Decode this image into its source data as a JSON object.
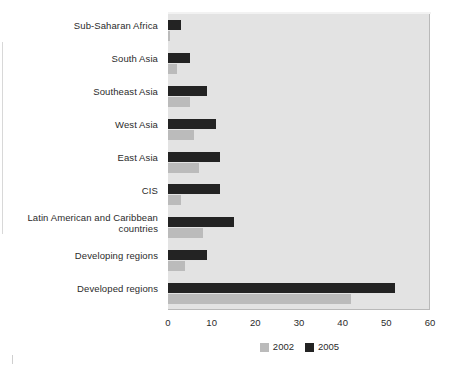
{
  "chart_data": {
    "type": "bar",
    "orientation": "horizontal",
    "title": "",
    "subtitle": "",
    "xlabel": "",
    "ylabel": "",
    "xlim": [
      0,
      60
    ],
    "xticks": [
      0,
      10,
      20,
      30,
      40,
      50,
      60
    ],
    "xtick_labels": [
      "0",
      "10",
      "20",
      "30",
      "40",
      "50",
      "60"
    ],
    "grid": false,
    "legend_position": "bottom-center",
    "categories": [
      "Sub-Saharan Africa",
      "South Asia",
      "Southeast Asia",
      "West Asia",
      "East Asia",
      "CIS",
      "Latin American and Caribbean countries",
      "Developing regions",
      "Developed regions"
    ],
    "series": [
      {
        "name": "2002",
        "color": "#bbbbbb",
        "values": [
          0.5,
          2,
          5,
          6,
          7,
          3,
          8,
          4,
          42
        ]
      },
      {
        "name": "2005",
        "color": "#232323",
        "values": [
          3,
          5,
          9,
          11,
          12,
          12,
          15,
          9,
          52
        ]
      }
    ],
    "legend": [
      "2002",
      "2005"
    ],
    "plot_background": "#e3e3e3",
    "page_background": "#ffffff"
  }
}
